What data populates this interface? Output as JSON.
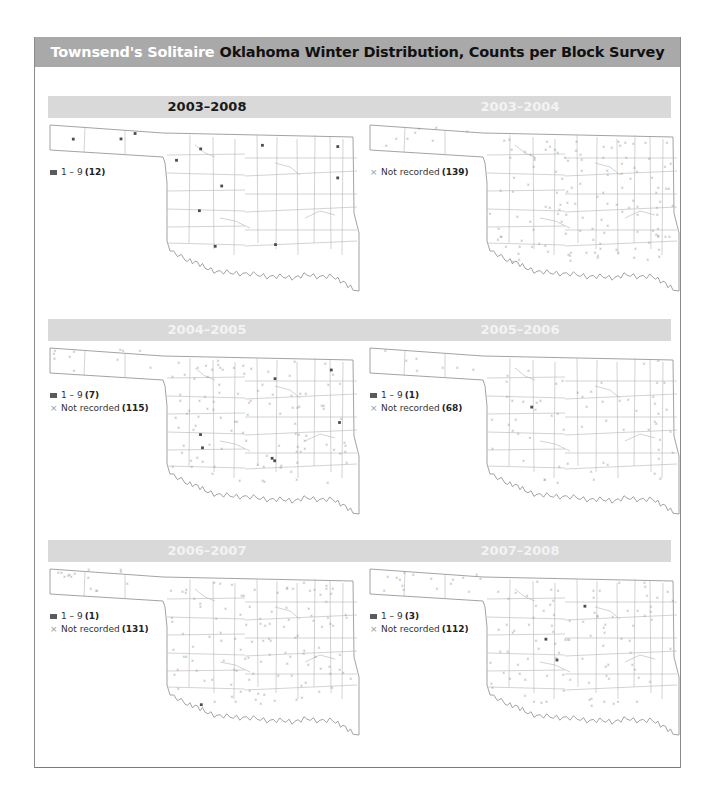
{
  "header": {
    "species": "Townsend's Solitaire",
    "title": "Oklahoma Winter Distribution, Counts per Block Survey"
  },
  "colors": {
    "title_bar": "#a9a9a9",
    "year_bar": "#d9d9d9",
    "recorded_marker": "#5b5b5b",
    "not_recorded_marker": "#9a9a9a"
  },
  "legend_labels": {
    "range": "1 – 9",
    "not_recorded": "Not recorded"
  },
  "rows": [
    {
      "left_year": "2003–2008",
      "right_year": "2003–2004"
    },
    {
      "left_year": "2004–2005",
      "right_year": "2005–2006"
    },
    {
      "left_year": "2006–2007",
      "right_year": "2007–2008"
    }
  ],
  "panels": [
    {
      "id": "p2003_2008",
      "period": "2003–2008",
      "legend": [
        {
          "type": "recorded",
          "count": "(12)"
        }
      ]
    },
    {
      "id": "p2003_2004",
      "period": "2003–2004",
      "legend": [
        {
          "type": "not_recorded",
          "count": "(139)"
        }
      ]
    },
    {
      "id": "p2004_2005",
      "period": "2004–2005",
      "legend": [
        {
          "type": "recorded",
          "count": "(7)"
        },
        {
          "type": "not_recorded",
          "count": "(115)"
        }
      ]
    },
    {
      "id": "p2005_2006",
      "period": "2005–2006",
      "legend": [
        {
          "type": "recorded",
          "count": "(1)"
        },
        {
          "type": "not_recorded",
          "count": "(68)"
        }
      ]
    },
    {
      "id": "p2006_2007",
      "period": "2006–2007",
      "legend": [
        {
          "type": "recorded",
          "count": "(1)"
        },
        {
          "type": "not_recorded",
          "count": "(131)"
        }
      ]
    },
    {
      "id": "p2007_2008",
      "period": "2007–2008",
      "legend": [
        {
          "type": "recorded",
          "count": "(3)"
        },
        {
          "type": "not_recorded",
          "count": "(112)"
        }
      ]
    }
  ],
  "chart_data": [
    {
      "type": "scatter",
      "title": "2003–2008",
      "series": [
        {
          "name": "1 – 9",
          "count": 12
        }
      ]
    },
    {
      "type": "scatter",
      "title": "2003–2004",
      "series": [
        {
          "name": "Not recorded",
          "count": 139
        }
      ]
    },
    {
      "type": "scatter",
      "title": "2004–2005",
      "series": [
        {
          "name": "1 – 9",
          "count": 7
        },
        {
          "name": "Not recorded",
          "count": 115
        }
      ]
    },
    {
      "type": "scatter",
      "title": "2005–2006",
      "series": [
        {
          "name": "1 – 9",
          "count": 1
        },
        {
          "name": "Not recorded",
          "count": 68
        }
      ]
    },
    {
      "type": "scatter",
      "title": "2006–2007",
      "series": [
        {
          "name": "1 – 9",
          "count": 1
        },
        {
          "name": "Not recorded",
          "count": 131
        }
      ]
    },
    {
      "type": "scatter",
      "title": "2007–2008",
      "series": [
        {
          "name": "1 – 9",
          "count": 3
        },
        {
          "name": "Not recorded",
          "count": 112
        }
      ]
    }
  ]
}
